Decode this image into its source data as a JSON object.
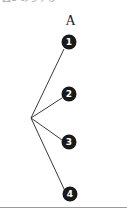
{
  "page": {
    "width": 127,
    "height": 214,
    "background_color": "#ffffff",
    "clipped_header_text": "図1 あらすじ",
    "figure_label": "A"
  },
  "colors": {
    "node_fill": "#1a1a1a",
    "node_text": "#ffffff",
    "line": "#3a3a3a",
    "rule": "#9a9a9a",
    "label_text": "#1c1c1c"
  },
  "diagram": {
    "type": "radial-node-diagram",
    "hub": {
      "name": "hub-vertex",
      "x": 31,
      "y": 118
    },
    "nodes": [
      {
        "id": 1,
        "label": "1",
        "x": 69,
        "y": 42,
        "name": "node-1"
      },
      {
        "id": 2,
        "label": "2",
        "x": 69,
        "y": 94,
        "name": "node-2"
      },
      {
        "id": 3,
        "label": "3",
        "x": 69,
        "y": 142,
        "name": "node-3"
      },
      {
        "id": 4,
        "label": "4",
        "x": 70,
        "y": 194,
        "name": "node-4"
      }
    ],
    "edges": [
      {
        "from": "hub",
        "to": 1,
        "x1": 31,
        "y1": 118,
        "x2": 64,
        "y2": 49
      },
      {
        "from": "hub",
        "to": 2,
        "x1": 31,
        "y1": 118,
        "x2": 62,
        "y2": 98
      },
      {
        "from": "hub",
        "to": 3,
        "x1": 31,
        "y1": 118,
        "x2": 62,
        "y2": 140
      },
      {
        "from": "hub",
        "to": 4,
        "x1": 31,
        "y1": 118,
        "x2": 65,
        "y2": 191
      }
    ]
  },
  "bottom_rule": {
    "y": 207,
    "visible": true
  }
}
